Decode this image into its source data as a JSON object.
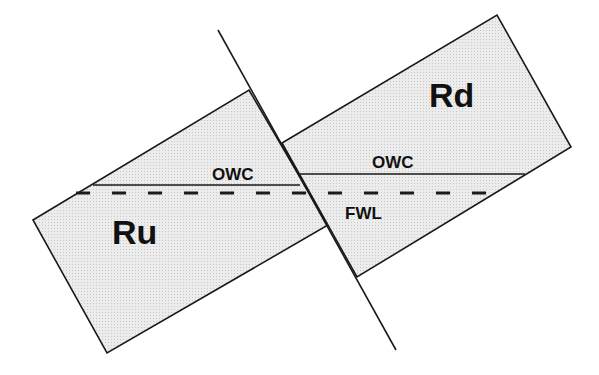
{
  "diagram": {
    "type": "fault-block cross-section",
    "blocks": [
      {
        "id": "Ru",
        "label": "Ru",
        "description": "upthrown block"
      },
      {
        "id": "Rd",
        "label": "Rd",
        "description": "downthrown block"
      }
    ],
    "contacts": [
      {
        "id": "owc-ru",
        "label": "OWC",
        "block": "Ru",
        "style": "solid"
      },
      {
        "id": "owc-rd",
        "label": "OWC",
        "block": "Rd",
        "style": "solid"
      },
      {
        "id": "fwl",
        "label": "FWL",
        "style": "dashed"
      }
    ],
    "fault": {
      "label": ""
    },
    "colors": {
      "block_fill": "#e3e3e3",
      "line": "#1a1a1a",
      "background": "#ffffff"
    }
  },
  "labels": {
    "ru": "Ru",
    "rd": "Rd",
    "owc_left": "OWC",
    "owc_right": "OWC",
    "fwl": "FWL"
  }
}
